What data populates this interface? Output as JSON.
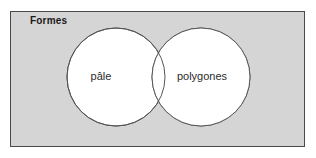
{
  "diagram": {
    "type": "venn",
    "universe": {
      "label": "Formes",
      "fill_color": "#d5d5d5",
      "border_color": "#4a4a4a"
    },
    "sets": [
      {
        "id": "left",
        "label": "pâle",
        "fill_color": "#ffffff",
        "stroke_color": "#555555",
        "cx": 116,
        "cy": 77,
        "r": 49
      },
      {
        "id": "right",
        "label": "polygones",
        "fill_color": "#ffffff",
        "stroke_color": "#555555",
        "cx": 201,
        "cy": 77,
        "r": 49
      }
    ],
    "intersection": {
      "label": "",
      "fill_color": "#ffffff"
    },
    "background_color": "#ffffff"
  }
}
